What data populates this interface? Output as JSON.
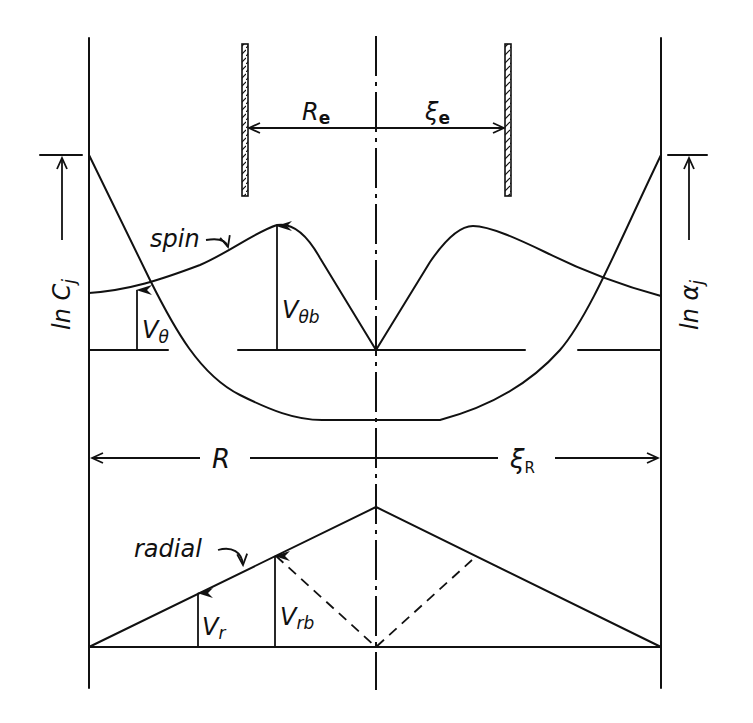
{
  "figure": {
    "type": "schematic diagram",
    "colors": {
      "ink": "#111111",
      "background": "#ffffff"
    }
  },
  "labels": {
    "re": "R",
    "re_sub": "e",
    "xie": "ξ",
    "xie_sub": "e",
    "r": "R",
    "xir": "ξ",
    "xir_sub": "R",
    "ln_c": "ln C",
    "ln_c_sub": "j",
    "ln_alpha": "ln α",
    "ln_alpha_sub": "j",
    "spin": "spin",
    "radial": "radial",
    "v_theta": "V",
    "v_theta_sub": "θ",
    "v_theta_b": "V",
    "v_theta_b_sub": "θb",
    "v_r": "V",
    "v_r_sub": "r",
    "v_rb": "V",
    "v_rb_sub": "rb"
  },
  "curves": {
    "spin_profile": "rises from wall to peak Vθb near vortex-finder radius, falls to zero on axis; symmetric",
    "ln_profile": "ln C_j (left) and ln α_j (right): maximum at outer wall, flat minimum across core",
    "radial_profile": "linear rise from wall to maximum at axis; dashed mirror line from V_rb to axis"
  }
}
